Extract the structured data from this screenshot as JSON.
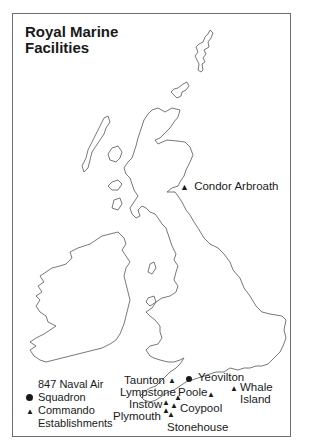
{
  "map": {
    "title_line1": "Royal Marine",
    "title_line2": "Facilities",
    "colors": {
      "outline": "#555555",
      "frame": "#6e6e6e",
      "text": "#1a1a1a"
    }
  },
  "legend": {
    "circle_label_line1": "847 Naval Air",
    "circle_label_line2": "Squadron",
    "triangle_label_line1": "Commando",
    "triangle_label_line2": "Establishments",
    "circle_symbol": "●",
    "triangle_symbol": "▲"
  },
  "locations": [
    {
      "name": "Condor Arbroath",
      "type": "triangle"
    },
    {
      "name": "Yeovilton",
      "type": "circle"
    },
    {
      "name": "Taunton",
      "type": "triangle"
    },
    {
      "name": "Lympstone",
      "type": "triangle"
    },
    {
      "name": "Poole",
      "type": "triangle"
    },
    {
      "name": "Instow",
      "type": "triangle"
    },
    {
      "name": "Plymouth",
      "type": "triangle"
    },
    {
      "name": "Coypool",
      "type": "triangle"
    },
    {
      "name": "Stonehouse",
      "type": "triangle"
    },
    {
      "name": "Whale",
      "type": "triangle"
    },
    {
      "name": "Island",
      "type": "triangle"
    }
  ]
}
